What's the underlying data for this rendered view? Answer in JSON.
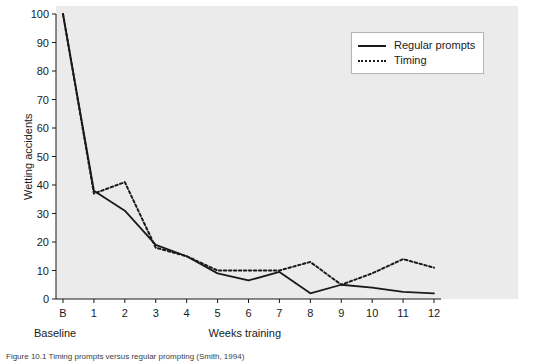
{
  "chart_data": {
    "type": "line",
    "title": "",
    "xlabel": "Weeks training",
    "ylabel": "Wetting accidents",
    "x": [
      "B",
      "1",
      "2",
      "3",
      "4",
      "5",
      "6",
      "7",
      "8",
      "9",
      "10",
      "11",
      "12"
    ],
    "xtick_labels": [
      "B",
      "1",
      "2",
      "3",
      "4",
      "5",
      "6",
      "7",
      "8",
      "9",
      "10",
      "11",
      "12"
    ],
    "baseline_note": "Baseline",
    "ytick_labels": [
      "0",
      "10",
      "20",
      "30",
      "40",
      "50",
      "60",
      "70",
      "80",
      "90",
      "100"
    ],
    "ylim": [
      0,
      100
    ],
    "ytick_step": 10,
    "grid": false,
    "legend_position": "top-right",
    "series": [
      {
        "name": "Regular prompts",
        "style": "solid",
        "color": "#1a1a1a",
        "values": [
          100,
          38,
          31,
          19,
          15,
          9,
          6.5,
          9.5,
          2,
          5,
          4,
          2.5,
          2
        ]
      },
      {
        "name": "Timing",
        "style": "dotted",
        "color": "#1a1a1a",
        "values": [
          100,
          37,
          41,
          18,
          15,
          10,
          10,
          10,
          13,
          5,
          9,
          14,
          11
        ]
      }
    ]
  },
  "legend": {
    "entries": [
      {
        "label": "Regular prompts",
        "style": "solid"
      },
      {
        "label": "Timing",
        "style": "dotted"
      }
    ]
  },
  "labels": {
    "y_axis": "Wetting accidents",
    "x_axis": "Weeks training",
    "baseline": "Baseline"
  },
  "caption": "Figure 10.1  Timing prompts versus regular prompting (Smith, 1994)"
}
